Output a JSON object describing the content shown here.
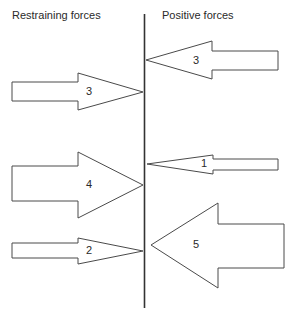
{
  "diagram": {
    "type": "force-field-analysis",
    "headings": {
      "left": "Restraining forces",
      "right": "Positive forces"
    },
    "divider": {
      "x": 144.5,
      "y1": 14,
      "y2": 308
    },
    "restraining_forces": [
      {
        "label": "3",
        "strength": 3
      },
      {
        "label": "4",
        "strength": 4
      },
      {
        "label": "2",
        "strength": 2
      }
    ],
    "positive_forces": [
      {
        "label": "3",
        "strength": 3
      },
      {
        "label": "1",
        "strength": 1
      },
      {
        "label": "5",
        "strength": 5
      }
    ],
    "colors": {
      "stroke": "#4a4a4a",
      "divider": "#333333",
      "text": "#2a2a2a",
      "background": "#ffffff"
    }
  }
}
